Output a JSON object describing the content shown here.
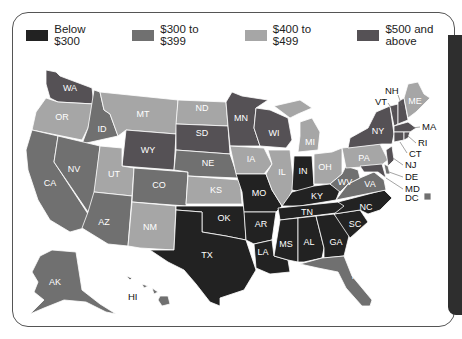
{
  "legend": [
    {
      "label": "Below $300",
      "color": "#222222",
      "key": "below_300"
    },
    {
      "label": "$300 to $399",
      "color": "#707070",
      "key": "300_399"
    },
    {
      "label": "$400 to $499",
      "color": "#a6a6a6",
      "key": "400_499"
    },
    {
      "label": "$500 and above",
      "color": "#555155",
      "key": "500_up"
    }
  ],
  "states": {
    "WA": "500_up",
    "OR": "400_499",
    "CA": "300_399",
    "ID": "300_399",
    "NV": "300_399",
    "MT": "400_499",
    "WY": "500_up",
    "UT": "400_499",
    "AZ": "300_399",
    "CO": "300_399",
    "NM": "400_499",
    "ND": "400_499",
    "SD": "500_up",
    "NE": "300_399",
    "KS": "400_499",
    "OK": "below_300",
    "TX": "below_300",
    "MN": "500_up",
    "IA": "400_499",
    "MO": "below_300",
    "AR": "below_300",
    "LA": "below_300",
    "WI": "500_up",
    "IL": "400_499",
    "MI": "400_499",
    "IN": "below_300",
    "OH": "400_499",
    "KY": "below_300",
    "TN": "below_300",
    "MS": "below_300",
    "AL": "below_300",
    "GA": "below_300",
    "FL": "300_399",
    "SC": "below_300",
    "NC": "below_300",
    "VA": "300_399",
    "WV": "300_399",
    "PA": "400_499",
    "NY": "500_up",
    "VT": "500_up",
    "NH": "500_up",
    "ME": "400_499",
    "MA": "500_up",
    "RI": "500_up",
    "CT": "500_up",
    "NJ": "500_up",
    "DE": "300_399",
    "MD": "500_up",
    "DC": "300_399",
    "AK": "300_399",
    "HI": "300_399"
  },
  "labels": {
    "WA": "WA",
    "OR": "OR",
    "CA": "CA",
    "ID": "ID",
    "NV": "NV",
    "MT": "MT",
    "WY": "WY",
    "UT": "UT",
    "AZ": "AZ",
    "CO": "CO",
    "NM": "NM",
    "ND": "ND",
    "SD": "SD",
    "NE": "NE",
    "KS": "KS",
    "OK": "OK",
    "TX": "TX",
    "MN": "MN",
    "IA": "IA",
    "MO": "MO",
    "AR": "AR",
    "LA": "LA",
    "WI": "WI",
    "IL": "IL",
    "MI": "MI",
    "IN": "IN",
    "OH": "OH",
    "KY": "KY",
    "TN": "TN",
    "MS": "MS",
    "AL": "AL",
    "GA": "GA",
    "FL": "FL",
    "SC": "SC",
    "NC": "NC",
    "VA": "VA",
    "WV": "WV",
    "PA": "PA",
    "NY": "NY",
    "VT": "VT",
    "NH": "NH",
    "ME": "ME",
    "MA": "MA",
    "RI": "RI",
    "CT": "CT",
    "NJ": "NJ",
    "DE": "DE",
    "MD": "MD",
    "DC": "DC",
    "AK": "AK",
    "HI": "HI"
  }
}
